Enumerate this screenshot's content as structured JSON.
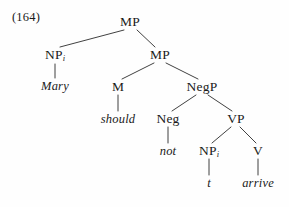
{
  "figure": {
    "example_number": "(164)",
    "sentence": "Mary should not arrive",
    "background_color": "#fefefe",
    "line_color": "#2b2b2b",
    "text_color": "#1a1a1a"
  },
  "nodes": {
    "mp_root": {
      "label": "MP",
      "x": 130,
      "y": 22,
      "type": "category"
    },
    "np_subj": {
      "label": "NP",
      "sub": "i",
      "x": 55,
      "y": 55,
      "type": "category"
    },
    "mary": {
      "label": "Mary",
      "x": 55,
      "y": 86,
      "type": "terminal"
    },
    "mp_inner": {
      "label": "MP",
      "x": 160,
      "y": 55,
      "type": "category"
    },
    "m_head": {
      "label": "M",
      "x": 118,
      "y": 87,
      "type": "category"
    },
    "should": {
      "label": "should",
      "x": 118,
      "y": 119,
      "type": "terminal"
    },
    "negp": {
      "label": "NegP",
      "x": 202,
      "y": 87,
      "type": "category"
    },
    "neg": {
      "label": "Neg",
      "x": 168,
      "y": 119,
      "type": "category"
    },
    "not": {
      "label": "not",
      "x": 168,
      "y": 151,
      "type": "terminal"
    },
    "vp": {
      "label": "VP",
      "x": 236,
      "y": 119,
      "type": "category"
    },
    "np_trace": {
      "label": "NP",
      "sub": "i",
      "x": 209,
      "y": 151,
      "type": "category"
    },
    "trace": {
      "label": "t",
      "x": 209,
      "y": 183,
      "type": "terminal"
    },
    "v": {
      "label": "V",
      "x": 258,
      "y": 151,
      "type": "category"
    },
    "arrive": {
      "label": "arrive",
      "x": 258,
      "y": 183,
      "type": "terminal"
    }
  },
  "edges": [
    {
      "from": "mp_root",
      "to": "np_subj",
      "x1": 124,
      "y1": 30,
      "x2": 60,
      "y2": 47
    },
    {
      "from": "mp_root",
      "to": "mp_inner",
      "x1": 137,
      "y1": 30,
      "x2": 155,
      "y2": 47
    },
    {
      "from": "np_subj",
      "to": "mary",
      "x1": 55,
      "y1": 64,
      "x2": 55,
      "y2": 78
    },
    {
      "from": "mp_inner",
      "to": "m_head",
      "x1": 154,
      "y1": 63,
      "x2": 122,
      "y2": 79
    },
    {
      "from": "mp_inner",
      "to": "negp",
      "x1": 166,
      "y1": 63,
      "x2": 198,
      "y2": 79
    },
    {
      "from": "m_head",
      "to": "should",
      "x1": 118,
      "y1": 95,
      "x2": 118,
      "y2": 111
    },
    {
      "from": "negp",
      "to": "neg",
      "x1": 196,
      "y1": 95,
      "x2": 172,
      "y2": 111
    },
    {
      "from": "negp",
      "to": "vp",
      "x1": 208,
      "y1": 95,
      "x2": 232,
      "y2": 111
    },
    {
      "from": "neg",
      "to": "not",
      "x1": 168,
      "y1": 127,
      "x2": 168,
      "y2": 143
    },
    {
      "from": "vp",
      "to": "np_trace",
      "x1": 231,
      "y1": 127,
      "x2": 212,
      "y2": 143
    },
    {
      "from": "vp",
      "to": "v",
      "x1": 240,
      "y1": 127,
      "x2": 256,
      "y2": 143
    },
    {
      "from": "np_trace",
      "to": "trace",
      "x1": 209,
      "y1": 159,
      "x2": 209,
      "y2": 175
    },
    {
      "from": "v",
      "to": "arrive",
      "x1": 258,
      "y1": 159,
      "x2": 258,
      "y2": 175
    }
  ]
}
